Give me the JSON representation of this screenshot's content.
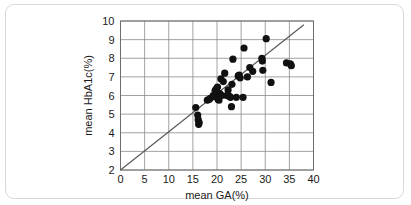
{
  "figure": {
    "frame_color": "#d8d8d8",
    "background": "#ffffff"
  },
  "chart_data": {
    "type": "scatter",
    "title": "",
    "xlabel": "mean GA(%)",
    "ylabel": "mean HbA1c(%)",
    "xlim": [
      0,
      40
    ],
    "ylim": [
      2,
      10
    ],
    "xticks": [
      0,
      5,
      10,
      15,
      20,
      25,
      30,
      35,
      40
    ],
    "yticks": [
      2,
      3,
      4,
      5,
      6,
      7,
      8,
      9,
      10
    ],
    "xtick_labels": [
      "0",
      "5",
      "10",
      "15",
      "20",
      "25",
      "30",
      "35",
      "40"
    ],
    "ytick_labels": [
      "2",
      "3",
      "4",
      "5",
      "6",
      "7",
      "8",
      "9",
      "10"
    ],
    "grid": true,
    "legend": null,
    "marker": {
      "shape": "circle",
      "color": "#111111",
      "size": 3.6
    },
    "series": [
      {
        "name": "patients",
        "points": [
          [
            15.6,
            5.35
          ],
          [
            16.0,
            4.95
          ],
          [
            16.1,
            4.7
          ],
          [
            16.2,
            4.45
          ],
          [
            16.3,
            4.55
          ],
          [
            18.0,
            5.75
          ],
          [
            18.4,
            5.8
          ],
          [
            18.6,
            5.85
          ],
          [
            19.2,
            6.0
          ],
          [
            19.5,
            5.95
          ],
          [
            19.6,
            6.25
          ],
          [
            19.8,
            6.35
          ],
          [
            19.9,
            6.1
          ],
          [
            20.0,
            6.0
          ],
          [
            20.1,
            6.45
          ],
          [
            20.2,
            5.8
          ],
          [
            20.4,
            5.75
          ],
          [
            20.6,
            6.1
          ],
          [
            20.8,
            6.9
          ],
          [
            21.0,
            6.0
          ],
          [
            21.3,
            6.75
          ],
          [
            21.6,
            7.2
          ],
          [
            22.0,
            6.0
          ],
          [
            22.3,
            6.3
          ],
          [
            22.6,
            5.95
          ],
          [
            22.8,
            5.9
          ],
          [
            23.0,
            5.4
          ],
          [
            23.1,
            6.6
          ],
          [
            23.3,
            7.95
          ],
          [
            24.0,
            5.9
          ],
          [
            24.4,
            7.05
          ],
          [
            24.6,
            7.1
          ],
          [
            24.8,
            6.95
          ],
          [
            25.4,
            5.9
          ],
          [
            25.6,
            8.55
          ],
          [
            26.3,
            7.0
          ],
          [
            26.8,
            7.5
          ],
          [
            27.4,
            7.3
          ],
          [
            29.3,
            8.0
          ],
          [
            29.4,
            7.85
          ],
          [
            29.5,
            7.35
          ],
          [
            30.2,
            9.05
          ],
          [
            31.2,
            6.7
          ],
          [
            34.4,
            7.75
          ],
          [
            35.2,
            7.7
          ],
          [
            35.4,
            7.6
          ]
        ]
      }
    ],
    "fit_line": {
      "name": "regression-line",
      "color": "#555555",
      "x_start": 0.0,
      "y_start": 2.0,
      "x_end": 38.0,
      "y_end": 9.8
    }
  }
}
